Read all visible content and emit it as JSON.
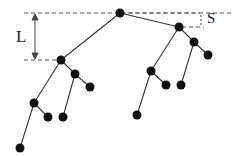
{
  "labels": {
    "L": "L",
    "S": "S"
  },
  "colors": {
    "node": "#111111",
    "edge": "#333333",
    "guide": "#555555"
  },
  "nodes": [
    {
      "id": "root",
      "x": 120,
      "y": 13
    },
    {
      "id": "a",
      "x": 179,
      "y": 27
    },
    {
      "id": "b",
      "x": 194,
      "y": 42
    },
    {
      "id": "b1",
      "x": 208,
      "y": 55
    },
    {
      "id": "b2",
      "x": 181,
      "y": 85
    },
    {
      "id": "c",
      "x": 151,
      "y": 71
    },
    {
      "id": "c1",
      "x": 166,
      "y": 85
    },
    {
      "id": "c2",
      "x": 137,
      "y": 115
    },
    {
      "id": "l",
      "x": 61,
      "y": 60
    },
    {
      "id": "m",
      "x": 75,
      "y": 74
    },
    {
      "id": "m1",
      "x": 90,
      "y": 87
    },
    {
      "id": "m2",
      "x": 63,
      "y": 117
    },
    {
      "id": "p",
      "x": 34,
      "y": 103
    },
    {
      "id": "p1",
      "x": 48,
      "y": 117
    },
    {
      "id": "p2",
      "x": 20,
      "y": 148
    }
  ],
  "edges": [
    [
      "root",
      "a"
    ],
    [
      "root",
      "l"
    ],
    [
      "a",
      "b"
    ],
    [
      "a",
      "c"
    ],
    [
      "b",
      "b1"
    ],
    [
      "b",
      "b2"
    ],
    [
      "c",
      "c1"
    ],
    [
      "c",
      "c2"
    ],
    [
      "l",
      "m"
    ],
    [
      "l",
      "p"
    ],
    [
      "m",
      "m1"
    ],
    [
      "m",
      "m2"
    ],
    [
      "p",
      "p1"
    ],
    [
      "p",
      "p2"
    ]
  ]
}
